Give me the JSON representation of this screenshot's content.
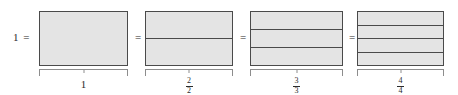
{
  "diagram": {
    "lhs": "1 =",
    "equals": "=",
    "fill_color": "#e4e4e4",
    "stroke_color": "#4a4a4a",
    "brace_color": "#8d8d8d",
    "text_color": "#2b2b2b",
    "groups": [
      {
        "parts": 1,
        "label_type": "whole",
        "label": "1",
        "numerator": "",
        "denominator": "",
        "left": 39,
        "width": 89
      },
      {
        "parts": 2,
        "label_type": "fraction",
        "label": "2/2",
        "numerator": "2",
        "denominator": "2",
        "left": 145,
        "width": 88
      },
      {
        "parts": 3,
        "label_type": "fraction",
        "label": "3/3",
        "numerator": "3",
        "denominator": "3",
        "left": 250,
        "width": 93
      },
      {
        "parts": 4,
        "label_type": "fraction",
        "label": "4/4",
        "numerator": "4",
        "denominator": "4",
        "left": 357,
        "width": 87
      }
    ],
    "equal_signs": [
      {
        "left": 131
      },
      {
        "left": 236
      },
      {
        "left": 345
      }
    ]
  }
}
